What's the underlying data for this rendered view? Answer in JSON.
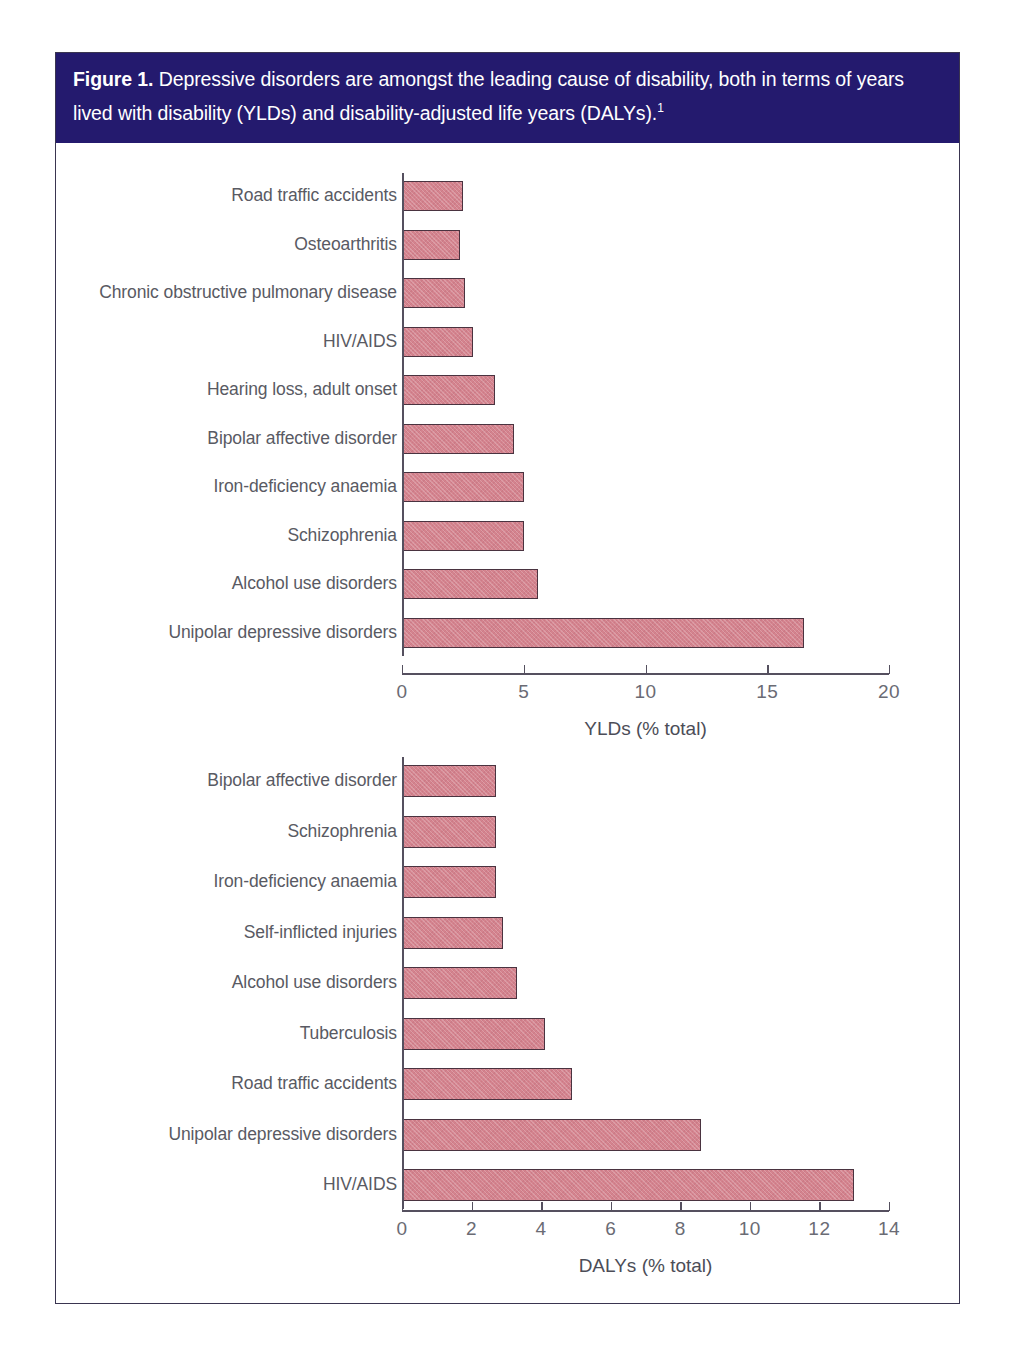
{
  "caption": {
    "figure_label": "Figure 1.",
    "text": "Depressive disorders are amongst the leading cause of disability, both in terms of years lived with disability (YLDs) and disability-adjusted life years (DALYs).",
    "superscript": "1"
  },
  "colors": {
    "header_background": "#241a6e",
    "header_text": "#ffffff",
    "bar_fill": "#d4838e",
    "bar_outline": "#4a3340",
    "axis": "#55505f",
    "label_text": "#595a63",
    "frame_border": "#3a3550"
  },
  "chart_data": [
    {
      "id": "ylds",
      "type": "bar",
      "orientation": "horizontal",
      "title": "",
      "xlabel": "YLDs (% total)",
      "ylabel": "",
      "xlim": [
        0,
        20
      ],
      "xticks": [
        0,
        5,
        10,
        15,
        20
      ],
      "xtick_labels": [
        "0",
        "5",
        "10",
        "15",
        "20"
      ],
      "grid": false,
      "legend": "none",
      "categories": [
        "Road traffic accidents",
        "Osteoarthritis",
        "Chronic obstructive pulmonary disease",
        "HIV/AIDS",
        "Hearing loss, adult onset",
        "Bipolar affective disorder",
        "Iron-deficiency anaemia",
        "Schizophrenia",
        "Alcohol use disorders",
        "Unipolar depressive disorders"
      ],
      "values": [
        2.5,
        2.4,
        2.6,
        2.9,
        3.8,
        4.6,
        5.0,
        5.0,
        5.6,
        16.5
      ]
    },
    {
      "id": "dalys",
      "type": "bar",
      "orientation": "horizontal",
      "title": "",
      "xlabel": "DALYs (% total)",
      "ylabel": "",
      "xlim": [
        0,
        14
      ],
      "xticks": [
        0,
        2,
        4,
        6,
        8,
        10,
        12,
        14
      ],
      "xtick_labels": [
        "0",
        "2",
        "4",
        "6",
        "8",
        "10",
        "12",
        "14"
      ],
      "grid": false,
      "legend": "none",
      "categories": [
        "Bipolar affective disorder",
        "Schizophrenia",
        "Iron-deficiency anaemia",
        "Self-inflicted injuries",
        "Alcohol use disorders",
        "Tuberculosis",
        "Road traffic accidents",
        "Unipolar depressive disorders",
        "HIV/AIDS"
      ],
      "values": [
        2.7,
        2.7,
        2.7,
        2.9,
        3.3,
        4.1,
        4.9,
        8.6,
        13.0
      ]
    }
  ]
}
